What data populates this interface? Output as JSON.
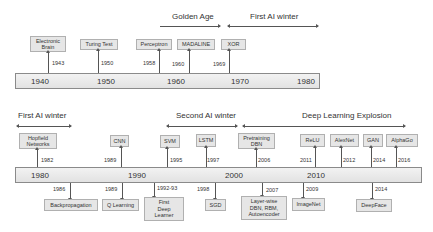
{
  "top": {
    "eras": [
      {
        "label": "Golden Age",
        "x": 172,
        "y": 13
      },
      {
        "label": "First AI winter",
        "x": 250,
        "y": 13
      }
    ],
    "axis_ticks": [
      "1940",
      "1950",
      "1960",
      "1970",
      "1980"
    ],
    "events": [
      {
        "label": "Electronic\nBrain",
        "year": "1943"
      },
      {
        "label": "Turing Test",
        "year": "1950"
      },
      {
        "label": "Perceptron",
        "year": "1958"
      },
      {
        "label": "MADALINE",
        "year": "1960"
      },
      {
        "label": "XOR",
        "year": "1969"
      }
    ]
  },
  "bottom": {
    "eras": [
      {
        "label": "First AI winter"
      },
      {
        "label": "Second AI winter"
      },
      {
        "label": "Deep Learning Explosion"
      }
    ],
    "axis_ticks": [
      "1980",
      "1990",
      "2000",
      "2010"
    ],
    "events_above": [
      {
        "label": "Hopfield\nNetworks",
        "year": "1982"
      },
      {
        "label": "CNN",
        "year": "1989"
      },
      {
        "label": "SVM",
        "year": "1995"
      },
      {
        "label": "LSTM",
        "year": "1997"
      },
      {
        "label": "Pretraining\nDBN",
        "year": "2006"
      },
      {
        "label": "ReLU",
        "year": "2011"
      },
      {
        "label": "AlexNet",
        "year": "2012"
      },
      {
        "label": "GAN",
        "year": "2014"
      },
      {
        "label": "AlphaGo",
        "year": "2016"
      }
    ],
    "events_below": [
      {
        "label": "Backpropagation",
        "year": "1986"
      },
      {
        "label": "Q Learning",
        "year": "1989"
      },
      {
        "label": "First\nDeep\nLearner",
        "year": "1992-93"
      },
      {
        "label": "SGD",
        "year": "1998"
      },
      {
        "label": "Layer-wise\nDBN, RBM,\nAutoencoder",
        "year": "2007"
      },
      {
        "label": "ImageNet",
        "year": "2009"
      },
      {
        "label": "DeepFace",
        "year": "2014"
      }
    ]
  }
}
